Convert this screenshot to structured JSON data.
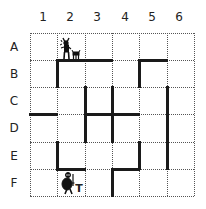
{
  "board": {
    "columns": [
      "1",
      "2",
      "3",
      "4",
      "5",
      "6"
    ],
    "rows": [
      "A",
      "B",
      "C",
      "D",
      "E",
      "F"
    ],
    "grid": {
      "x_lines": [
        30,
        57,
        85,
        112,
        139,
        167,
        194
      ],
      "y_lines": [
        33,
        60,
        87,
        114,
        142,
        169,
        196
      ]
    },
    "walls": [
      {
        "type": "h",
        "y": 60,
        "x1": 57,
        "x2": 112
      },
      {
        "type": "h",
        "y": 60,
        "x1": 139,
        "x2": 167
      },
      {
        "type": "h",
        "y": 114,
        "x1": 30,
        "x2": 57
      },
      {
        "type": "h",
        "y": 114,
        "x1": 85,
        "x2": 139
      },
      {
        "type": "h",
        "y": 169,
        "x1": 57,
        "x2": 85
      },
      {
        "type": "h",
        "y": 169,
        "x1": 112,
        "x2": 139
      },
      {
        "type": "v",
        "x": 57,
        "y1": 60,
        "y2": 87
      },
      {
        "type": "v",
        "x": 57,
        "y1": 142,
        "y2": 169
      },
      {
        "type": "v",
        "x": 85,
        "y1": 87,
        "y2": 142
      },
      {
        "type": "v",
        "x": 112,
        "y1": 87,
        "y2": 142
      },
      {
        "type": "v",
        "x": 112,
        "y1": 169,
        "y2": 196
      },
      {
        "type": "v",
        "x": 139,
        "y1": 60,
        "y2": 87
      },
      {
        "type": "v",
        "x": 139,
        "y1": 142,
        "y2": 169
      },
      {
        "type": "v",
        "x": 167,
        "y1": 87,
        "y2": 169
      }
    ],
    "pieces": [
      {
        "name": "minotaur",
        "cell": "A2",
        "companion": "small-creature"
      },
      {
        "name": "knight",
        "cell": "F2",
        "tag": "T"
      }
    ],
    "wall_color": "#1a1a1a",
    "grid_color": "#555555"
  }
}
